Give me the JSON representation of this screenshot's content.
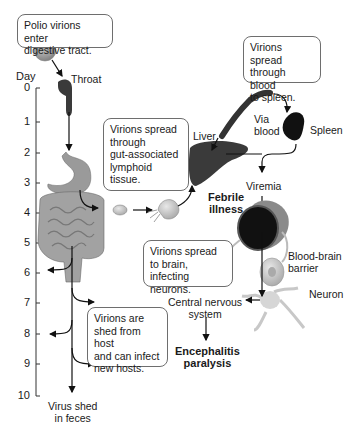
{
  "diagram": {
    "axis": {
      "label": "Day",
      "ticks": [
        "0",
        "1",
        "2",
        "3",
        "4",
        "5",
        "6",
        "7",
        "8",
        "9",
        "10"
      ]
    },
    "boxes": {
      "enter": "Polio virions enter\ndigestive tract.",
      "spleen_spread": "Virions spread\nthrough blood\nto spleen.",
      "lymphoid": "Virions spread\nthrough\ngut-associated\nlymphoid\ntissue.",
      "brain_spread": "Virions spread\nto brain, infecting\nneurons.",
      "shed": "Virions are\nshed from host\nand can infect\nnew hosts."
    },
    "labels": {
      "throat": "Throat",
      "via_blood": "Via\nblood",
      "spleen": "Spleen",
      "liver": "Liver",
      "viremia": "Viremia",
      "febrile": "Febrile\nillness",
      "bbb": "Blood-brain\nbarrier",
      "neuron": "Neuron",
      "cns": "Central nervous\nsystem",
      "encephalitis": "Encephalitis\nparalysis",
      "feces": "Virus shed\nin feces"
    },
    "colors": {
      "organ_gray": "#8a8a8a",
      "dark_organ": "#2a2a2a",
      "box_border": "#6e6e6e"
    }
  }
}
